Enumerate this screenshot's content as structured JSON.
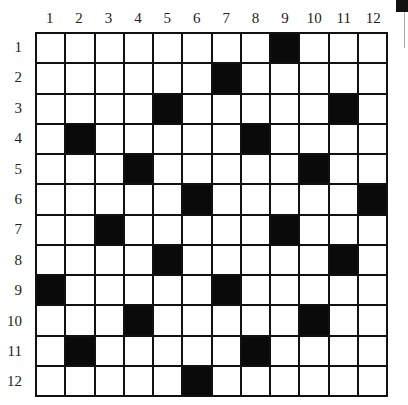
{
  "puzzle": {
    "type": "crossword-grid",
    "rows": 12,
    "cols": 12,
    "column_labels": [
      "1",
      "2",
      "3",
      "4",
      "5",
      "6",
      "7",
      "8",
      "9",
      "10",
      "11",
      "12"
    ],
    "row_labels": [
      "1",
      "2",
      "3",
      "4",
      "5",
      "6",
      "7",
      "8",
      "9",
      "10",
      "11",
      "12"
    ],
    "black_squares": [
      [
        1,
        9
      ],
      [
        2,
        7
      ],
      [
        3,
        5
      ],
      [
        3,
        11
      ],
      [
        4,
        2
      ],
      [
        4,
        8
      ],
      [
        5,
        4
      ],
      [
        5,
        10
      ],
      [
        6,
        6
      ],
      [
        6,
        12
      ],
      [
        7,
        3
      ],
      [
        7,
        9
      ],
      [
        8,
        5
      ],
      [
        8,
        11
      ],
      [
        9,
        1
      ],
      [
        9,
        7
      ],
      [
        10,
        4
      ],
      [
        10,
        10
      ],
      [
        11,
        2
      ],
      [
        11,
        8
      ],
      [
        12,
        6
      ]
    ],
    "colors": {
      "black": "#0a0a0a",
      "white": "#ffffff",
      "line": "#111111"
    }
  }
}
